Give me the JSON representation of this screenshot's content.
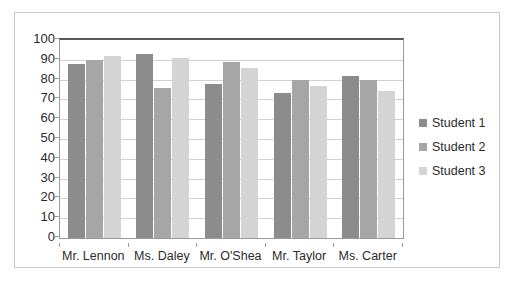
{
  "chart_data": {
    "type": "bar",
    "title": "",
    "xlabel": "",
    "ylabel": "",
    "ylim": [
      0,
      100
    ],
    "yticks": [
      0,
      10,
      20,
      30,
      40,
      50,
      60,
      70,
      80,
      90,
      100
    ],
    "grid": true,
    "legend_position": "right",
    "categories": [
      "Mr. Lennon",
      "Ms. Daley",
      "Mr. O'Shea",
      "Mr. Taylor",
      "Ms. Carter"
    ],
    "series": [
      {
        "name": "Student 1",
        "color": "#8c8c8c",
        "values": [
          88,
          93,
          78,
          73,
          82
        ]
      },
      {
        "name": "Student 2",
        "color": "#a6a6a6",
        "values": [
          90,
          76,
          89,
          80,
          80
        ]
      },
      {
        "name": "Student 3",
        "color": "#d4d4d4",
        "values": [
          92,
          91,
          86,
          77,
          74
        ]
      }
    ]
  }
}
